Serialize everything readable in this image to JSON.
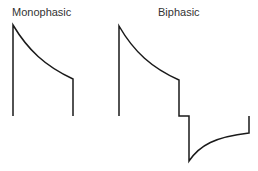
{
  "labels": {
    "monophasic": "Monophasic",
    "biphasic": "Biphasic"
  },
  "colors": {
    "stroke": "#1a1a1a",
    "text": "#333333",
    "background": "#ffffff"
  },
  "waveforms": [
    {
      "name": "Monophasic",
      "description": "Single positive exponential decay pulse, truncated"
    },
    {
      "name": "Biphasic",
      "description": "Positive exponential decay followed by step and negative exponential phase"
    }
  ]
}
